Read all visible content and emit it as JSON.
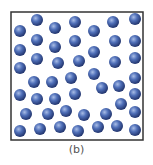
{
  "figure": {
    "caption": "(b)",
    "box": {
      "x": 11,
      "y": 12,
      "width": 132,
      "height": 128,
      "stroke": "#333333",
      "fill": "#ffffff"
    },
    "sphere": {
      "radius": 6,
      "fill_light": "#a9bde6",
      "fill_mid": "#4f6fb8",
      "fill_dark": "#22356e"
    },
    "particles": [
      [
        20,
        31
      ],
      [
        37,
        20
      ],
      [
        55,
        28
      ],
      [
        75,
        22
      ],
      [
        94,
        31
      ],
      [
        113,
        22
      ],
      [
        135,
        19
      ],
      [
        20,
        50
      ],
      [
        37,
        40
      ],
      [
        55,
        47
      ],
      [
        75,
        41
      ],
      [
        94,
        52
      ],
      [
        115,
        41
      ],
      [
        135,
        41
      ],
      [
        20,
        68
      ],
      [
        37,
        59
      ],
      [
        58,
        63
      ],
      [
        79,
        61
      ],
      [
        115,
        62
      ],
      [
        135,
        58
      ],
      [
        34,
        82
      ],
      [
        52,
        82
      ],
      [
        71,
        78
      ],
      [
        94,
        74
      ],
      [
        135,
        78
      ],
      [
        20,
        95
      ],
      [
        37,
        99
      ],
      [
        55,
        99
      ],
      [
        75,
        94
      ],
      [
        102,
        88
      ],
      [
        119,
        86
      ],
      [
        135,
        94
      ],
      [
        26,
        114
      ],
      [
        48,
        114
      ],
      [
        66,
        111
      ],
      [
        84,
        115
      ],
      [
        106,
        114
      ],
      [
        121,
        104
      ],
      [
        135,
        112
      ],
      [
        20,
        131
      ],
      [
        40,
        129
      ],
      [
        60,
        127
      ],
      [
        78,
        131
      ],
      [
        98,
        127
      ],
      [
        117,
        126
      ],
      [
        135,
        130
      ]
    ]
  }
}
